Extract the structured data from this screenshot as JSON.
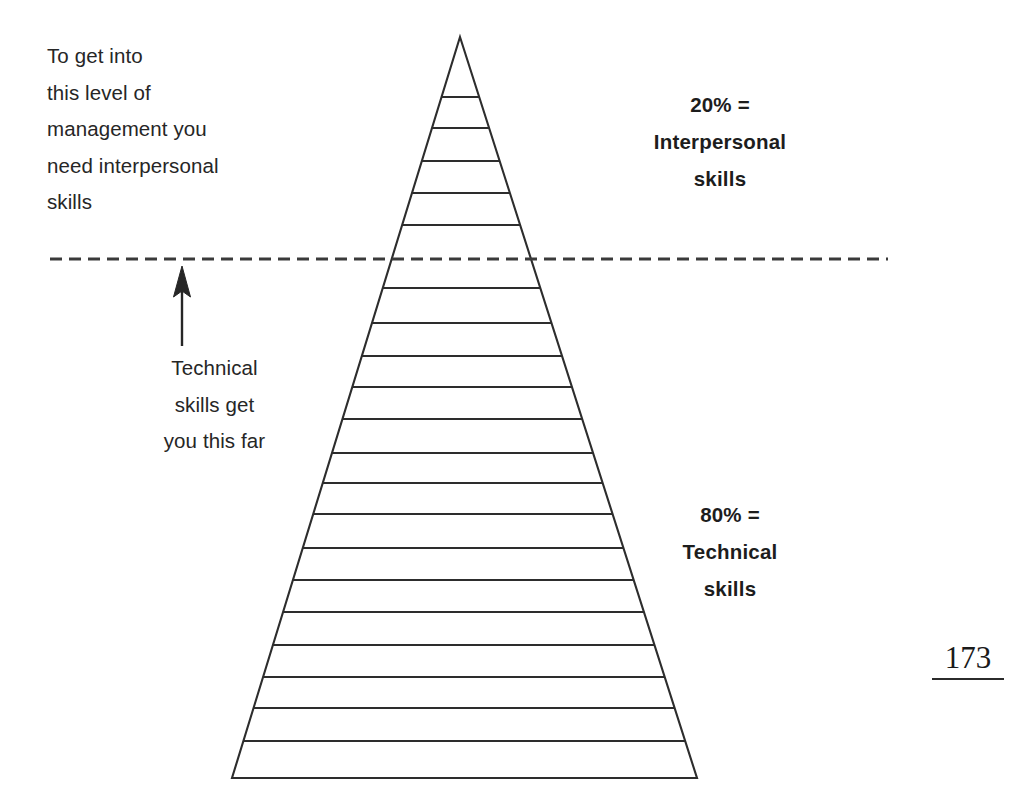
{
  "page": {
    "width": 1034,
    "height": 810,
    "background": "#ffffff",
    "page_number": "173"
  },
  "annotations": {
    "top_left_note": "To get into\nthis level of\nmanagement you\nneed interpersonal\nskills",
    "arrow_caption": "Technical\nskills get\nyou this far",
    "arrow_icon_name": "up-arrow-icon"
  },
  "callouts": [
    {
      "id": "interpersonal",
      "text": "20% =\nInterpersonal\nskills",
      "percent": "20%",
      "label": "Interpersonal skills"
    },
    {
      "id": "technical",
      "text": "80% =\nTechnical\nskills",
      "percent": "80%",
      "label": "Technical skills"
    }
  ],
  "chart_data": {
    "type": "pie",
    "categories": [
      "Technical skills",
      "Interpersonal skills"
    ],
    "values": [
      80,
      20
    ],
    "value_labels": [
      "80% =\nTechnical\nskills",
      "20% =\nInterpersonal\nskills"
    ],
    "xlabel": "",
    "ylabel": "",
    "legend": "none",
    "grid": false,
    "notes": [
      "To get into this level of management you need interpersonal skills",
      "Technical skills get you this far"
    ]
  },
  "pyramid": {
    "stroke": "#2d2d2d",
    "stroke_width": 2.1,
    "fill": "none",
    "apex": {
      "x": 460,
      "y": 37
    },
    "base_left": {
      "x": 232,
      "y": 778
    },
    "base_right": {
      "x": 697,
      "y": 778
    },
    "division_lines_y": [
      97,
      128,
      161,
      193,
      225,
      288,
      323,
      356,
      387,
      419,
      453,
      483,
      514,
      548,
      580,
      612,
      645,
      677,
      708,
      741
    ],
    "threshold_line": {
      "y": 259,
      "x_start": 50,
      "x_end": 888,
      "style": "dashed",
      "dash": "12 7",
      "stroke": "#3a3a3a",
      "stroke_width": 3
    },
    "arrow": {
      "x": 182,
      "tip_y": 266,
      "tail_y": 346,
      "stroke": "#262626"
    }
  }
}
